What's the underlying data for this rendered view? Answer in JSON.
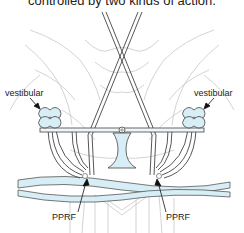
{
  "caption": "controlled by two kinds of action.",
  "labels": {
    "vestibular_left": "vestibular",
    "vestibular_right": "vestibular",
    "pprf_left": "PPRF",
    "pprf_right": "PPRF"
  },
  "colors": {
    "outline": "#444444",
    "faint": "#b8b8b8",
    "fill_blue": "#d8eef6",
    "arrow": "#111111"
  }
}
